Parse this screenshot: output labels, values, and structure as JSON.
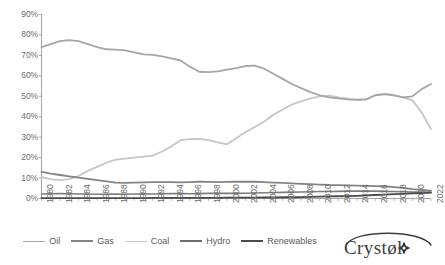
{
  "chart_data": {
    "type": "line",
    "title": "",
    "xlabel": "",
    "ylabel": "",
    "ylim": [
      0,
      90
    ],
    "ytick_values": [
      0,
      10,
      20,
      30,
      40,
      50,
      60,
      70,
      80,
      90
    ],
    "ytick_labels": [
      "0%",
      "10%",
      "20%",
      "30%",
      "40%",
      "50%",
      "60%",
      "70%",
      "80%",
      "90%"
    ],
    "grid": false,
    "legend_position": "bottom",
    "x": [
      1980,
      1981,
      1982,
      1983,
      1984,
      1985,
      1986,
      1987,
      1988,
      1989,
      1990,
      1991,
      1992,
      1993,
      1994,
      1995,
      1996,
      1997,
      1998,
      1999,
      2000,
      2001,
      2002,
      2003,
      2004,
      2005,
      2006,
      2007,
      2008,
      2009,
      2010,
      2011,
      2012,
      2013,
      2014,
      2015,
      2016,
      2017,
      2018,
      2019,
      2020,
      2021,
      2022
    ],
    "xtick_labels": [
      "1980",
      "1982",
      "1984",
      "1986",
      "1988",
      "1990",
      "1992",
      "1994",
      "1996",
      "1998",
      "2000",
      "2002",
      "2004",
      "2006",
      "2008",
      "2010",
      "2012",
      "2014",
      "2016",
      "2018",
      "2020",
      "2022"
    ],
    "series": [
      {
        "name": "Oil",
        "color": "#a6a6a6",
        "width": 1.8,
        "values": [
          74.0,
          75.5,
          77.0,
          77.5,
          77.0,
          75.5,
          74.0,
          73.0,
          72.8,
          72.5,
          71.5,
          70.5,
          70.3,
          69.5,
          68.5,
          67.5,
          64.5,
          62.0,
          61.8,
          62.2,
          63.0,
          63.8,
          64.8,
          65.0,
          63.5,
          61.0,
          58.5,
          56.0,
          54.0,
          52.0,
          50.5,
          49.5,
          49.0,
          48.5,
          48.3,
          48.5,
          50.5,
          51.0,
          50.5,
          49.5,
          50.0,
          53.5,
          56.0
        ]
      },
      {
        "name": "Gas",
        "color": "#848484",
        "width": 1.8,
        "values": [
          13.0,
          12.2,
          11.5,
          10.8,
          10.2,
          9.6,
          9.0,
          8.4,
          7.8,
          7.6,
          7.8,
          7.9,
          8.0,
          8.0,
          8.0,
          7.9,
          8.0,
          8.2,
          8.1,
          8.0,
          8.1,
          8.2,
          8.3,
          8.2,
          8.0,
          7.8,
          7.6,
          7.4,
          7.2,
          7.0,
          6.8,
          6.6,
          6.5,
          6.4,
          6.3,
          6.2,
          6.1,
          6.0,
          5.6,
          5.2,
          4.6,
          4.2,
          3.8
        ]
      },
      {
        "name": "Coal",
        "color": "#c6c6c6",
        "width": 1.8,
        "values": [
          10.5,
          9.5,
          9.0,
          9.5,
          11.0,
          13.5,
          15.5,
          17.5,
          19.0,
          19.5,
          20.0,
          20.5,
          21.0,
          23.0,
          25.5,
          28.5,
          29.0,
          29.2,
          28.5,
          27.5,
          26.5,
          29.5,
          32.5,
          35.0,
          37.5,
          41.0,
          43.5,
          46.0,
          47.5,
          49.0,
          50.0,
          50.3,
          49.5,
          48.8,
          48.2,
          48.5,
          50.5,
          51.0,
          50.5,
          49.5,
          48.0,
          42.0,
          34.0
        ]
      },
      {
        "name": "Hydro",
        "color": "#7d7d7d",
        "width": 1.6,
        "values": [
          2.2,
          2.3,
          2.4,
          2.3,
          2.2,
          2.2,
          2.1,
          2.1,
          2.2,
          2.1,
          2.2,
          2.3,
          2.2,
          2.3,
          2.4,
          2.4,
          2.3,
          2.4,
          2.5,
          2.5,
          2.6,
          2.5,
          2.6,
          2.7,
          2.8,
          2.9,
          3.0,
          3.1,
          3.2,
          3.3,
          3.4,
          3.4,
          3.5,
          3.6,
          3.6,
          3.6,
          3.6,
          3.5,
          3.4,
          3.3,
          3.2,
          3.1,
          3.0
        ]
      },
      {
        "name": "Renewables",
        "color": "#4a4a4a",
        "width": 1.8,
        "values": [
          0.2,
          0.2,
          0.2,
          0.2,
          0.2,
          0.2,
          0.2,
          0.2,
          0.2,
          0.2,
          0.2,
          0.2,
          0.3,
          0.3,
          0.3,
          0.3,
          0.3,
          0.3,
          0.3,
          0.3,
          0.4,
          0.4,
          0.4,
          0.4,
          0.5,
          0.5,
          0.6,
          0.6,
          0.7,
          0.8,
          0.9,
          1.0,
          1.1,
          1.2,
          1.3,
          1.5,
          1.7,
          1.9,
          2.1,
          2.3,
          2.5,
          2.7,
          2.9
        ]
      }
    ]
  },
  "axis": {
    "line_color": "#9a9a9a"
  },
  "legend": {
    "items": [
      {
        "label": "Oil",
        "color": "#a6a6a6",
        "width": 1.8
      },
      {
        "label": "Gas",
        "color": "#848484",
        "width": 2.2
      },
      {
        "label": "Coal",
        "color": "#c6c6c6",
        "width": 1.8
      },
      {
        "label": "Hydro",
        "color": "#6b6b6b",
        "width": 2.4
      },
      {
        "label": "Renewables",
        "color": "#4a4a4a",
        "width": 2.8
      }
    ]
  },
  "brand": {
    "wordmark": "Crystøl"
  },
  "caption": {
    "text": ""
  }
}
